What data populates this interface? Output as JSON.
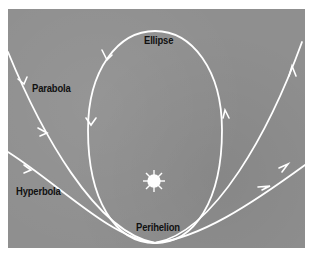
{
  "diagram": {
    "type": "orbit-types",
    "labels": {
      "ellipse": "Ellipse",
      "parabola": "Parabola",
      "hyperbola": "Hyperbola",
      "perihelion": "Perihelion"
    },
    "icons": {
      "sun": "sun-icon"
    },
    "colors": {
      "background": "#8f8f8f",
      "curves": "#ffffff",
      "text": "#111111",
      "frame": "#ffffff"
    }
  }
}
